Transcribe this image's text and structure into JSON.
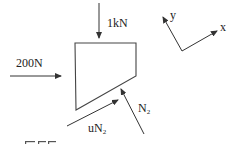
{
  "diagram": {
    "type": "free-body-diagram",
    "forces": {
      "top": {
        "label": "1kN"
      },
      "left": {
        "label": "200N"
      },
      "normal": {
        "label": "N",
        "sub": "2"
      },
      "friction": {
        "label": "uN",
        "sub": "2"
      }
    },
    "axes": {
      "x_label": "x",
      "y_label": "y"
    },
    "cropped_bottom_text": "Eff..."
  },
  "colors": {
    "stroke": "#333333",
    "text": "#222222",
    "background": "#ffffff"
  }
}
